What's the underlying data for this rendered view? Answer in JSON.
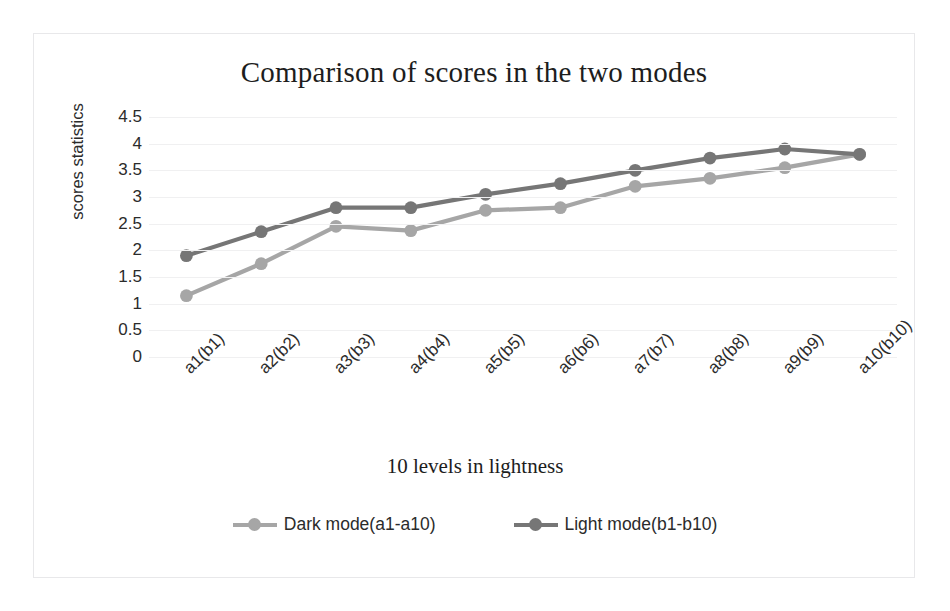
{
  "chart_data": {
    "type": "line",
    "title": "Comparison of scores in the two modes",
    "xlabel": "10 levels in lightness",
    "ylabel": "scores statistics",
    "categories": [
      "a1(b1)",
      "a2(b2)",
      "a3(b3)",
      "a4(b4)",
      "a5(b5)",
      "a6(b6)",
      "a7(b7)",
      "a8(b8)",
      "a9(b9)",
      "a10(b10)"
    ],
    "ylim": [
      0,
      4.5
    ],
    "yticks": [
      "4.5",
      "4",
      "3.5",
      "3",
      "2.5",
      "2",
      "1.5",
      "1",
      "0.5",
      "0"
    ],
    "ytick_values": [
      4.5,
      4,
      3.5,
      3,
      2.5,
      2,
      1.5,
      1,
      0.5,
      0
    ],
    "grid": true,
    "legend_position": "bottom",
    "series": [
      {
        "name": "Dark mode(a1-a10)",
        "color": "#a6a6a6",
        "marker": "circle",
        "values": [
          1.15,
          1.75,
          2.45,
          2.37,
          2.75,
          2.8,
          3.2,
          3.35,
          3.55,
          3.8
        ]
      },
      {
        "name": "Light mode(b1-b10)",
        "color": "#767676",
        "marker": "circle",
        "values": [
          1.9,
          2.35,
          2.8,
          2.8,
          3.05,
          3.25,
          3.5,
          3.73,
          3.9,
          3.8
        ]
      }
    ]
  },
  "frame": {
    "border_color": "#e8e8ea",
    "gridline_color": "#f0f0f1",
    "text_color": "#2b2b2b",
    "title_color": "#1d1d1d"
  }
}
